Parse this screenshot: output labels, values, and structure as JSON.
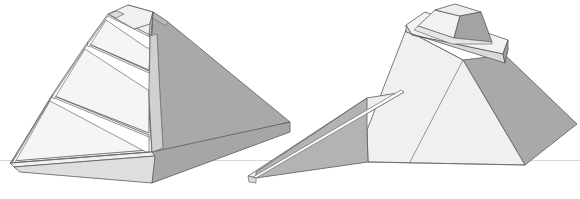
{
  "figure": {
    "title": "Stepped pyramid reconstruction — two views",
    "background_color": "#ffffff",
    "ground_line": {
      "label": "horizon-ground-line",
      "color": "#d8d8d8",
      "y": 160,
      "x_start": 0,
      "x_end": 580
    },
    "palette": {
      "face_light": "#f0f0ee",
      "face_lighter": "#f7f7f5",
      "face_mid": "#e2e2e0",
      "face_shadow": "#b3b3b1",
      "face_dark": "#a9a9a7",
      "face_darker": "#9e9e9c",
      "outline": "#5a5a5a",
      "outline_thin": "#6b6b6b",
      "white": "#ffffff"
    },
    "views": [
      {
        "id": "left-view",
        "name": "terraced-pyramid-view",
        "label": "Left figure: terraced pyramid with stepped corner and base plinth",
        "bounds": {
          "x": 0,
          "y": 0,
          "width": 290,
          "height": 199
        },
        "parts": [
          {
            "name": "pyramid-shadow-face-right",
            "tone": "face_dark"
          },
          {
            "name": "pyramid-light-face-left",
            "tone": "face_light"
          },
          {
            "name": "terrace-step-upper",
            "tone": "face_lighter"
          },
          {
            "name": "terrace-step-middle",
            "tone": "face_lighter"
          },
          {
            "name": "terrace-step-lower",
            "tone": "face_lighter"
          },
          {
            "name": "summit-platform",
            "tone": "face_mid"
          },
          {
            "name": "corner-pilaster",
            "tone": "face_mid"
          },
          {
            "name": "base-plinth",
            "tone": "face_light"
          }
        ]
      },
      {
        "id": "right-view",
        "name": "pyramid-with-ramp-view",
        "label": "Right figure: pyramid with summit temple and long access ramp",
        "bounds": {
          "x": 230,
          "y": 0,
          "width": 350,
          "height": 199
        },
        "parts": [
          {
            "name": "pyramid-front-left-face",
            "tone": "face_lighter"
          },
          {
            "name": "pyramid-right-face",
            "tone": "face_dark"
          },
          {
            "name": "pyramid-back-left-face",
            "tone": "face_mid"
          },
          {
            "name": "summit-cornice-slab",
            "tone": "face_light"
          },
          {
            "name": "summit-temple-left-face",
            "tone": "face_light"
          },
          {
            "name": "summit-temple-right-face",
            "tone": "face_darker"
          },
          {
            "name": "summit-temple-roof",
            "tone": "face_mid"
          },
          {
            "name": "access-ramp-top-surface",
            "tone": "face_light"
          },
          {
            "name": "access-ramp-side-face",
            "tone": "face_shadow"
          }
        ]
      }
    ]
  }
}
